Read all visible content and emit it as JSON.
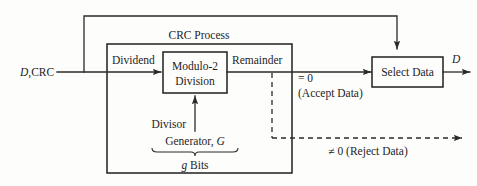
{
  "diagram": {
    "title": "CRC Process",
    "background_color": "#fdfdfc",
    "line_color": "#2a2a2a",
    "text_color": "#1e1e1e",
    "input_label_italic": "D",
    "input_label_rest": ",CRC",
    "process_box_label": "CRC Process",
    "division_box_line1": "Modulo-2",
    "division_box_line2": "Division",
    "dividend_label": "Dividend",
    "remainder_label": "Remainder",
    "divisor_label": "Divisor",
    "generator_label": "Generator, ",
    "generator_symbol": "G",
    "gbits_symbol": "g",
    "gbits_label": " Bits",
    "accept_condition": "= 0",
    "accept_text": "(Accept Data)",
    "reject_text": "≠ 0 (Reject Data)",
    "select_box_label": "Select Data",
    "output_label": "D"
  }
}
